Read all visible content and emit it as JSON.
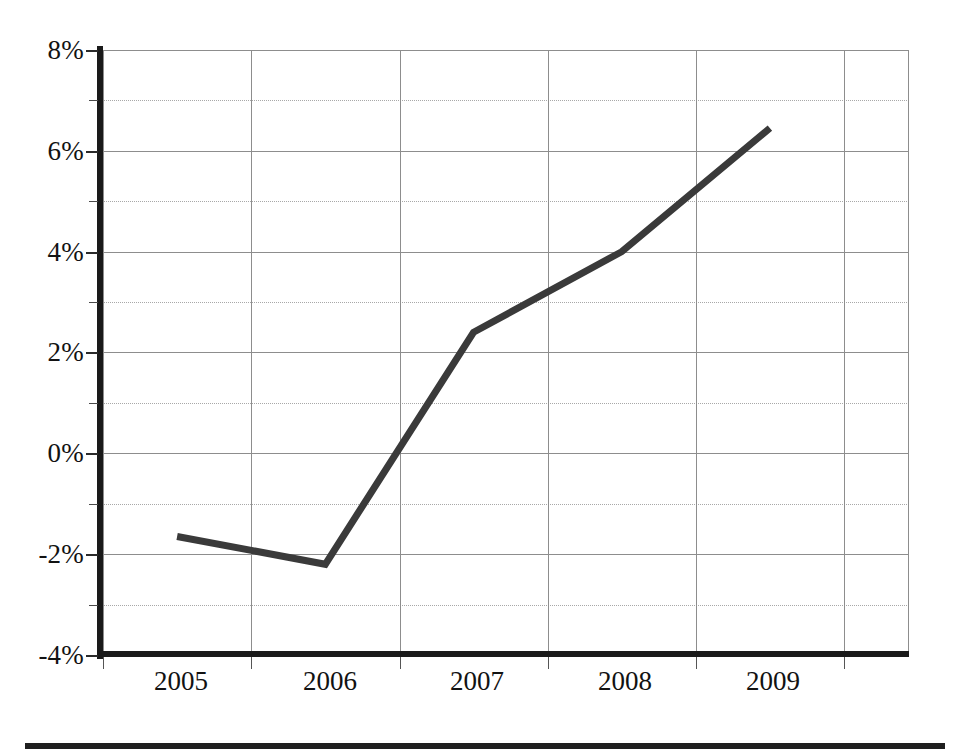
{
  "chart_data": {
    "type": "line",
    "title": "",
    "subtitle": "",
    "xlabel": "",
    "ylabel": "",
    "categories": [
      "2005",
      "2006",
      "2007",
      "2008",
      "2009"
    ],
    "x": [
      2005,
      2006,
      2007,
      2008,
      2009
    ],
    "values": [
      -1.65,
      -2.2,
      2.4,
      4.0,
      6.45
    ],
    "series": [
      {
        "name": "",
        "values": [
          -1.65,
          -2.2,
          2.4,
          4.0,
          6.45
        ]
      }
    ],
    "ylim": [
      -4,
      8
    ],
    "ytick_values": [
      8,
      6,
      4,
      2,
      0,
      -2,
      -4
    ],
    "ytick_labels": [
      "8%",
      "6%",
      "4%",
      "2%",
      "0%",
      "-2%",
      "-4%"
    ],
    "yminor_values": [
      7,
      5,
      3,
      1,
      -1,
      -3
    ],
    "xtick_labels": [
      "2005",
      "2006",
      "2007",
      "2008",
      "2009"
    ],
    "grid": "both",
    "legend": "none",
    "line_color": "#3a3a3a",
    "axis_color": "#1a1a1a",
    "grid_color": "#8d8d8d",
    "minor_grid_color": "#a8a8a8",
    "background_color": "#ffffff",
    "value_format": "percent",
    "annotations": []
  }
}
